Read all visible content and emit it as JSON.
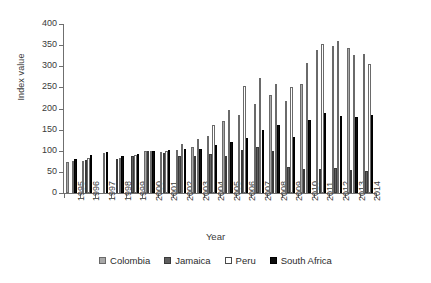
{
  "chart_data": {
    "type": "bar",
    "title": "",
    "xlabel": "Year",
    "ylabel": "Index value",
    "ylim": [
      0,
      400
    ],
    "yticks": [
      0,
      50,
      100,
      150,
      200,
      250,
      300,
      350,
      400
    ],
    "grid": false,
    "legend_position": "bottom",
    "categories": [
      "1995",
      "1996",
      "1997",
      "1998",
      "1999",
      "2000",
      "2001",
      "2002",
      "2003",
      "2004",
      "2005",
      "2006",
      "2007",
      "2008",
      "2009",
      "2010",
      "2011",
      "2012",
      "2013",
      "2014"
    ],
    "series": [
      {
        "name": "Colombia",
        "color": "#a8a8a8",
        "values": [
          73,
          75,
          null,
          null,
          null,
          99,
          97,
          101,
          110,
          135,
          170,
          185,
          211,
          231,
          218,
          259,
          338,
          349,
          344,
          328
        ]
      },
      {
        "name": "Jamaica",
        "color": "#5e5e5e",
        "values": [
          null,
          78,
          null,
          81,
          88,
          99,
          94,
          88,
          87,
          92,
          87,
          102,
          109,
          100,
          62,
          57,
          56,
          59,
          55,
          53
        ]
      },
      {
        "name": "Peru",
        "color": "#ffffff",
        "values": [
          76,
          83,
          95,
          84,
          90,
          100,
          100,
          115,
          128,
          162,
          196,
          253,
          272,
          258,
          250,
          308,
          352,
          359,
          327,
          306
        ]
      },
      {
        "name": "South Africa",
        "color": "#0d0d0d",
        "values": [
          80,
          91,
          96,
          88,
          92,
          99,
          102,
          105,
          104,
          113,
          120,
          131,
          149,
          161,
          133,
          172,
          189,
          183,
          181,
          185
        ]
      }
    ]
  },
  "legend": {
    "items": [
      {
        "label": "Colombia",
        "key": "colombia"
      },
      {
        "label": "Jamaica",
        "key": "jamaica"
      },
      {
        "label": "Peru",
        "key": "peru"
      },
      {
        "label": "South Africa",
        "key": "south"
      }
    ]
  }
}
